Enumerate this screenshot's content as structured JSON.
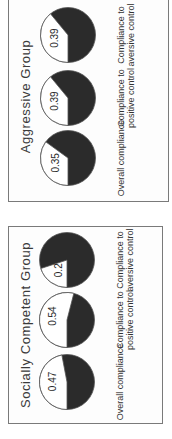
{
  "chart_data": [
    {
      "type": "pie",
      "title": "Socially Competent Group",
      "charts": [
        {
          "label": "Overall compliance",
          "value": 0.47
        },
        {
          "label": "Compliance to positive control",
          "value": 0.54
        },
        {
          "label": "Compliance to aversive control",
          "value": 0.2
        }
      ],
      "value_meaning": "proportion of compliance (white slice)",
      "colors": {
        "compliance": "#ffffff",
        "non_compliance": "#2b2b2b"
      }
    },
    {
      "type": "pie",
      "title": "Aggressive Group",
      "charts": [
        {
          "label": "Overall compliance",
          "value": 0.35
        },
        {
          "label": "Compliance to positive control",
          "value": 0.39
        },
        {
          "label": "Compliance to aversive control",
          "value": 0.39
        }
      ],
      "value_meaning": "proportion of compliance (white slice)",
      "colors": {
        "compliance": "#ffffff",
        "non_compliance": "#2b2b2b"
      }
    }
  ],
  "panels": [
    {
      "title": "Socially Competent Group",
      "pies": [
        {
          "label": "Overall compliance",
          "value_text": "0.47",
          "value": 0.47
        },
        {
          "label": "Compliance to positive control",
          "value_text": "0.54",
          "value": 0.54
        },
        {
          "label": "Compliance to aversive control",
          "value_text": "0.2",
          "value": 0.2
        }
      ]
    },
    {
      "title": "Aggressive Group",
      "pies": [
        {
          "label": "Overall compliance",
          "value_text": "0.35",
          "value": 0.35
        },
        {
          "label": "Compliance to positive control",
          "value_text": "0.39",
          "value": 0.39
        },
        {
          "label": "Compliance to aversive control",
          "value_text": "0.39",
          "value": 0.39
        }
      ]
    }
  ],
  "colors": {
    "dark_slice": "#2b2b2b",
    "light_slice": "#ffffff",
    "border": "#7a7a7a"
  }
}
